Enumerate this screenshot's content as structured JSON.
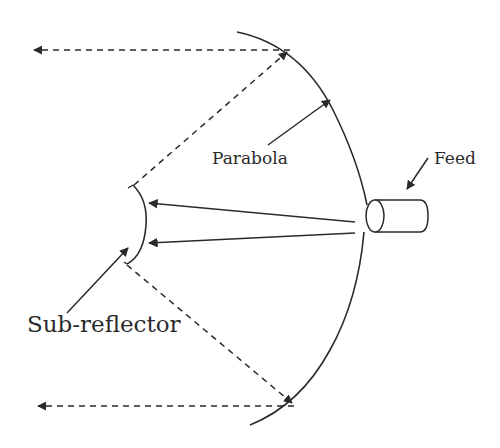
{
  "diagram": {
    "labels": {
      "parabola": "Parabola",
      "feed": "Feed",
      "sub_reflector": "Sub-reflector"
    },
    "components": [
      {
        "id": "parabola",
        "type": "main-reflector",
        "shape": "parabolic arc"
      },
      {
        "id": "sub_reflector",
        "type": "sub-reflector",
        "shape": "convex arc"
      },
      {
        "id": "feed",
        "type": "feed-horn",
        "shape": "cylinder"
      }
    ],
    "rays": [
      {
        "from": "feed",
        "to": "sub_reflector",
        "style": "solid",
        "count": 2
      },
      {
        "from": "sub_reflector",
        "to": "parabola",
        "style": "dashed",
        "count": 2
      },
      {
        "from": "parabola",
        "to": "left",
        "style": "dashed",
        "count": 2
      }
    ],
    "colors": {
      "line": "#2a2a2a",
      "background": "#ffffff"
    }
  }
}
